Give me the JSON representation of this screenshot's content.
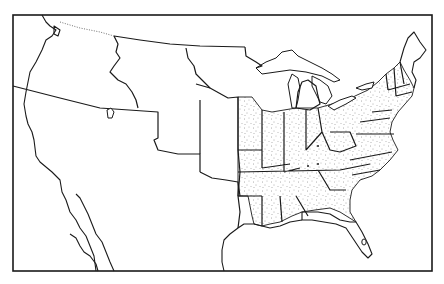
{
  "map": {
    "subject": "United States territorial map with stippled states",
    "colors": {
      "ink": "#1a1a1a",
      "paper": "#ffffff",
      "stipple": "#555555"
    },
    "regions": [
      {
        "name": "stippled-states-east",
        "style": "stippled"
      },
      {
        "name": "oregon-country",
        "style": "plain"
      },
      {
        "name": "unorganized-territory",
        "style": "plain"
      },
      {
        "name": "mexico",
        "style": "plain"
      },
      {
        "name": "michigan-territory",
        "style": "plain"
      },
      {
        "name": "arkansas-territory",
        "style": "stippled"
      },
      {
        "name": "florida-territory",
        "style": "plain"
      }
    ],
    "labels": []
  }
}
